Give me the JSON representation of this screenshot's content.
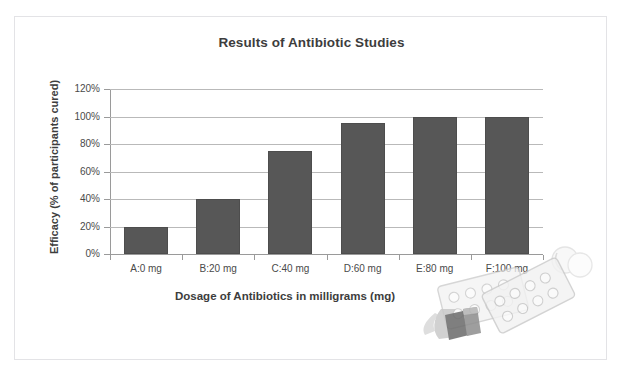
{
  "top_strip_text": "",
  "chart": {
    "title": "Results of Antibiotic Studies",
    "xlabel": "Dosage of Antibiotics in milligrams (mg)",
    "ylabel": "Efficacy (% of participants cured)",
    "y_ticks": [
      "0%",
      "20%",
      "40%",
      "60%",
      "80%",
      "100%",
      "120%"
    ],
    "bar_color": "#575757",
    "grid_color": "#b9b9b9",
    "axis_color": "#9a9a9a",
    "title_color": "#3d3d3d",
    "frame_color": "#e3e3e6"
  },
  "chart_data": {
    "type": "bar",
    "title": "Results of Antibiotic Studies",
    "xlabel": "Dosage of Antibiotics in milligrams (mg)",
    "ylabel": "Efficacy (% of participants cured)",
    "categories": [
      "A:0 mg",
      "B:20 mg",
      "C:40 mg",
      "D:60 mg",
      "E:80 mg",
      "F:100 mg"
    ],
    "values": [
      20,
      40,
      75,
      95,
      100,
      100
    ],
    "value_unit": "%",
    "ylim": [
      0,
      120
    ],
    "ytick_step": 20,
    "yticks": [
      0,
      20,
      40,
      60,
      80,
      100,
      120
    ],
    "ytick_labels": [
      "0%",
      "20%",
      "40%",
      "60%",
      "80%",
      "100%",
      "120%"
    ],
    "grid": "horizontal",
    "legend": "none",
    "series": [
      {
        "name": "Efficacy",
        "values": [
          20,
          40,
          75,
          95,
          100,
          100
        ]
      }
    ]
  },
  "decoration": {
    "photo_name": "pills-and-blister-packs-photo",
    "description": "faded grayscale photo of capsules and two blister packs of round pills"
  }
}
